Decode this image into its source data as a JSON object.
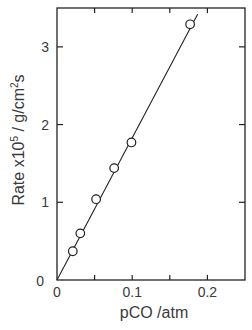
{
  "chart_data": {
    "type": "scatter",
    "title": "",
    "xlabel": "pCO /atm",
    "ylabel": "Rate x10⁵ / g/cm²s",
    "ylabel_parts": {
      "prefix": "Rate x10",
      "sup1": "5",
      "mid": " / g/cm",
      "sup2": "2",
      "suffix": "s"
    },
    "xlim": [
      0,
      0.25
    ],
    "ylim": [
      0,
      3.5
    ],
    "xticks": [
      0,
      0.05,
      0.1,
      0.15,
      0.2
    ],
    "xtick_labels": [
      "0",
      "",
      "0.1",
      "",
      "0.2"
    ],
    "yticks": [
      0,
      1,
      2,
      3
    ],
    "ytick_labels": [
      "0",
      "1",
      "2",
      "3"
    ],
    "grid": false,
    "legend": null,
    "series": [
      {
        "name": "measured",
        "marker": "open-circle",
        "x": [
          0.021,
          0.031,
          0.052,
          0.076,
          0.099,
          0.177
        ],
        "y": [
          0.37,
          0.6,
          1.04,
          1.44,
          1.77,
          3.29
        ]
      }
    ],
    "fit_line": {
      "name": "linear fit",
      "x": [
        0,
        0.187
      ],
      "y": [
        0,
        3.42
      ]
    }
  },
  "colors": {
    "axis": "#222222",
    "marker_fill": "#ffffff",
    "line": "#222222",
    "text": "#3a3a3a"
  }
}
